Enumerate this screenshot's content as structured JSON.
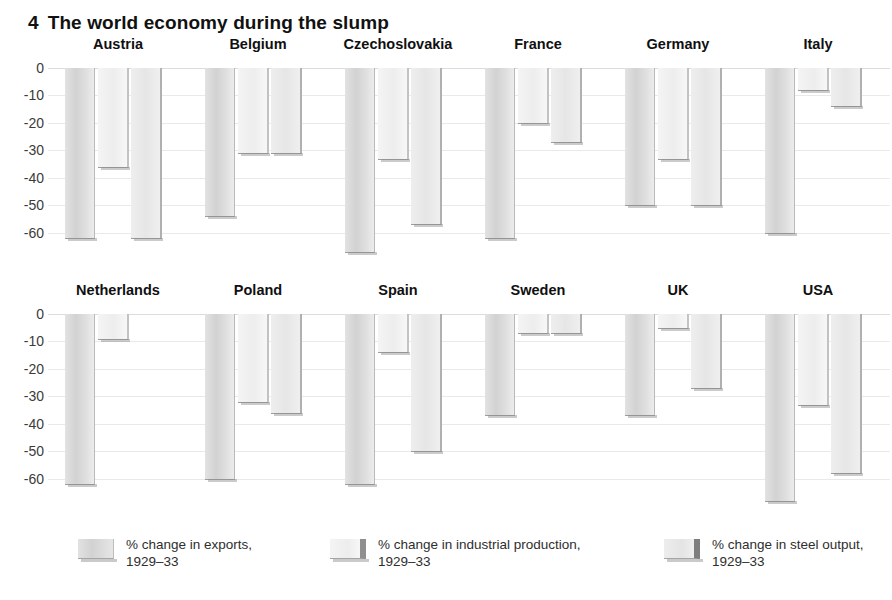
{
  "title": {
    "number": "4",
    "text": "The world economy during the slump"
  },
  "legend": {
    "position": "bottom",
    "items": [
      {
        "key": "exports",
        "line1": "% change in exports,",
        "line2": "1929–33",
        "swatch": "exports-swatch"
      },
      {
        "key": "industrial",
        "line1": "% change in industrial production,",
        "line2": "1929–33",
        "swatch": "industrial-production-swatch"
      },
      {
        "key": "steel",
        "line1": "% change in steel output,",
        "line2": "1929–33",
        "swatch": "steel-output-swatch"
      }
    ]
  },
  "axis": {
    "ticks": [
      "0",
      "-10",
      "-20",
      "-30",
      "-40",
      "-50",
      "-60"
    ],
    "values": [
      0,
      -10,
      -20,
      -30,
      -40,
      -50,
      -60
    ],
    "min": -70,
    "max": 0
  },
  "chart_data": {
    "type": "bar",
    "subtitle": "",
    "xlabel": "",
    "ylabel": "",
    "ylim": [
      -70,
      0
    ],
    "grid": true,
    "legend_position": "bottom",
    "orientation": "vertical",
    "layout": "small-multiples, 2 rows x 6 countries",
    "categories": [
      "Austria",
      "Belgium",
      "Czechoslovakia",
      "France",
      "Germany",
      "Italy",
      "Netherlands",
      "Poland",
      "Spain",
      "Sweden",
      "UK",
      "USA"
    ],
    "series": [
      {
        "name": "% change in exports, 1929–33",
        "values": [
          -62,
          -54,
          -67,
          -62,
          -50,
          -60,
          -62,
          -60,
          -62,
          -37,
          -37,
          -68
        ]
      },
      {
        "name": "% change in industrial production, 1929–33",
        "values": [
          -36,
          -31,
          -33,
          -20,
          -33,
          -8,
          -9,
          -32,
          -14,
          -7,
          -5,
          -33
        ]
      },
      {
        "name": "% change in steel output, 1929–33",
        "values": [
          -62,
          -31,
          -57,
          -27,
          -50,
          -14,
          null,
          -36,
          -50,
          -7,
          -27,
          -58
        ]
      }
    ],
    "rows": [
      {
        "countries": [
          {
            "name": "Austria",
            "exports": -62,
            "industrial": -36,
            "steel": -62
          },
          {
            "name": "Belgium",
            "exports": -54,
            "industrial": -31,
            "steel": -31
          },
          {
            "name": "Czechoslovakia",
            "exports": -67,
            "industrial": -33,
            "steel": -57
          },
          {
            "name": "France",
            "exports": -62,
            "industrial": -20,
            "steel": -27
          },
          {
            "name": "Germany",
            "exports": -50,
            "industrial": -33,
            "steel": -50
          },
          {
            "name": "Italy",
            "exports": -60,
            "industrial": -8,
            "steel": -14
          }
        ]
      },
      {
        "countries": [
          {
            "name": "Netherlands",
            "exports": -62,
            "industrial": -9,
            "steel": null
          },
          {
            "name": "Poland",
            "exports": -60,
            "industrial": -32,
            "steel": -36
          },
          {
            "name": "Spain",
            "exports": -62,
            "industrial": -14,
            "steel": -50
          },
          {
            "name": "Sweden",
            "exports": -37,
            "industrial": -7,
            "steel": -7
          },
          {
            "name": "UK",
            "exports": -37,
            "industrial": -5,
            "steel": -27
          },
          {
            "name": "USA",
            "exports": -68,
            "industrial": -33,
            "steel": -58
          }
        ]
      }
    ]
  },
  "colors": {
    "background": "#ffffff",
    "title": "#111111",
    "gridline": "#e9e9e9",
    "axis_text": "#3b3b3b",
    "bar_exports": "#d2d2d2",
    "bar_industrial": "#f0f0f0",
    "bar_steel": "#e8e8e8"
  }
}
